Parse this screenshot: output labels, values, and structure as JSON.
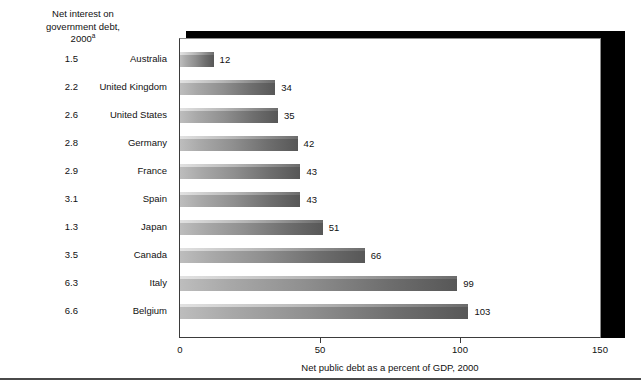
{
  "left_column_header": {
    "line1": "Net interest on",
    "line2": "government debt,",
    "line3": "2000",
    "superscript": "a"
  },
  "chart_data": {
    "type": "bar",
    "orientation": "horizontal",
    "title": "",
    "xlabel": "Net public debt as a percent of GDP, 2000",
    "ylabel": "",
    "xlim": [
      0,
      150
    ],
    "xticks": [
      0,
      50,
      100,
      150
    ],
    "xtick_labels": [
      "0",
      "50",
      "100",
      "150"
    ],
    "grid": false,
    "legend": null,
    "categories": [
      "Australia",
      "United Kingdom",
      "United States",
      "Germany",
      "France",
      "Spain",
      "Japan",
      "Canada",
      "Italy",
      "Belgium"
    ],
    "values": [
      12,
      34,
      35,
      42,
      43,
      43,
      51,
      66,
      99,
      103
    ],
    "value_labels": [
      "12",
      "34",
      "35",
      "42",
      "43",
      "43",
      "51",
      "66",
      "99",
      "103"
    ],
    "series": [
      {
        "name": "Net public debt as a percent of GDP, 2000",
        "values": [
          12,
          34,
          35,
          42,
          43,
          43,
          51,
          66,
          99,
          103
        ]
      },
      {
        "name": "Net interest on government debt, 2000",
        "values": [
          1.5,
          2.2,
          2.6,
          2.8,
          2.9,
          3.1,
          1.3,
          3.5,
          6.3,
          6.6
        ]
      }
    ],
    "interest_labels": [
      "1.5",
      "2.2",
      "2.6",
      "2.8",
      "2.9",
      "3.1",
      "1.3",
      "3.5",
      "6.3",
      "6.6"
    ],
    "colors": {
      "bar_light": "#bdbdbd",
      "bar_dark": "#575757",
      "shadow": "#000000",
      "text": "#111111",
      "axis": "#3b3b3b"
    }
  }
}
